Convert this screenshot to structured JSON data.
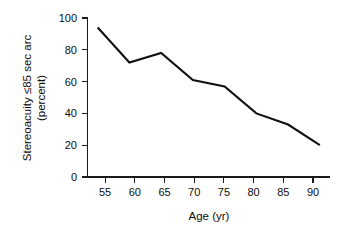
{
  "chart_data": {
    "type": "line",
    "title": "",
    "subtitle": "",
    "xlabel": "Age (yr)",
    "ylabel": "Stereoacuity ≤85 sec arc (percent)",
    "ylabel_line1": "Stereoacuity ≤85 sec arc",
    "ylabel_line2": "(percent)",
    "x": [
      55,
      60,
      65,
      70,
      75,
      80,
      85,
      90
    ],
    "values": [
      94,
      72,
      78,
      61,
      57,
      40,
      33,
      20
    ],
    "series": [
      {
        "name": "Stereoacuity ≤85 sec arc",
        "values": [
          94,
          72,
          78,
          61,
          57,
          40,
          33,
          20
        ]
      }
    ],
    "xlim": [
      53.4,
      91.6
    ],
    "ylim": [
      0,
      100
    ],
    "xticks": [
      55,
      60,
      65,
      70,
      75,
      80,
      85,
      90
    ],
    "xtick_labels": [
      "55",
      "60",
      "65",
      "70",
      "75",
      "80",
      "85",
      "90"
    ],
    "yticks": [
      0,
      20,
      40,
      60,
      80,
      100
    ],
    "ytick_labels": [
      "0",
      "20",
      "40",
      "60",
      "80",
      "100"
    ],
    "grid": false,
    "legend": false,
    "legend_position": "none",
    "line_color": "#111111",
    "axis_color": "#1a1a1a",
    "background_color": "#ffffff",
    "annotations": []
  }
}
